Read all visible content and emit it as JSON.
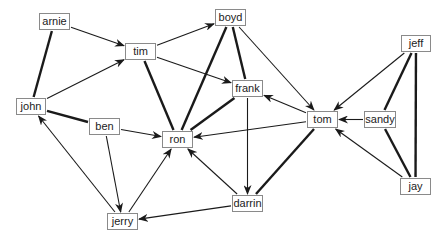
{
  "diagram": {
    "type": "directed-graph",
    "colors": {
      "line": "#1a1a1a",
      "node_border": "#8a8a8a",
      "text": "#222222",
      "background": "#ffffff"
    },
    "nodes": [
      {
        "id": "arnie",
        "label": "arnie",
        "x": 39,
        "y": 13,
        "w": 31
      },
      {
        "id": "tim",
        "label": "tim",
        "x": 125,
        "y": 43,
        "w": 31
      },
      {
        "id": "boyd",
        "label": "boyd",
        "x": 215,
        "y": 9,
        "w": 31
      },
      {
        "id": "frank",
        "label": "frank",
        "x": 232,
        "y": 80,
        "w": 31
      },
      {
        "id": "john",
        "label": "john",
        "x": 16,
        "y": 98,
        "w": 30
      },
      {
        "id": "ben",
        "label": "ben",
        "x": 89,
        "y": 118,
        "w": 31
      },
      {
        "id": "ron",
        "label": "ron",
        "x": 162,
        "y": 131,
        "w": 31
      },
      {
        "id": "tom",
        "label": "tom",
        "x": 307,
        "y": 111,
        "w": 31
      },
      {
        "id": "sandy",
        "label": "sandy",
        "x": 364,
        "y": 111,
        "w": 32
      },
      {
        "id": "jeff",
        "label": "jeff",
        "x": 401,
        "y": 35,
        "w": 30
      },
      {
        "id": "jay",
        "label": "jay",
        "x": 400,
        "y": 178,
        "w": 31
      },
      {
        "id": "darrin",
        "label": "darrin",
        "x": 232,
        "y": 195,
        "w": 31
      },
      {
        "id": "jerry",
        "label": "jerry",
        "x": 107,
        "y": 213,
        "w": 31
      }
    ],
    "edges": [
      {
        "from": "arnie",
        "to": "john",
        "style": "thick"
      },
      {
        "from": "arnie",
        "to": "tim",
        "style": "arrow"
      },
      {
        "from": "john",
        "to": "tim",
        "style": "arrow"
      },
      {
        "from": "john",
        "to": "ben",
        "style": "thick"
      },
      {
        "from": "tim",
        "to": "boyd",
        "style": "arrow"
      },
      {
        "from": "tim",
        "to": "frank",
        "style": "arrow"
      },
      {
        "from": "tim",
        "to": "ron",
        "style": "thick"
      },
      {
        "from": "boyd",
        "to": "ron",
        "style": "thick"
      },
      {
        "from": "boyd",
        "to": "frank",
        "style": "thick"
      },
      {
        "from": "boyd",
        "to": "tom",
        "style": "arrow"
      },
      {
        "from": "frank",
        "to": "ron",
        "style": "thick"
      },
      {
        "from": "frank",
        "to": "darrin",
        "style": "arrow"
      },
      {
        "from": "tom",
        "to": "frank",
        "style": "arrow"
      },
      {
        "from": "tom",
        "to": "ron",
        "style": "arrow"
      },
      {
        "from": "tom",
        "to": "darrin",
        "style": "thick"
      },
      {
        "from": "ben",
        "to": "ron",
        "style": "arrow"
      },
      {
        "from": "ben",
        "to": "jerry",
        "style": "arrow"
      },
      {
        "from": "jerry",
        "to": "john",
        "style": "arrow"
      },
      {
        "from": "jerry",
        "to": "ron",
        "style": "arrow"
      },
      {
        "from": "darrin",
        "to": "ron",
        "style": "arrow"
      },
      {
        "from": "darrin",
        "to": "jerry",
        "style": "arrow"
      },
      {
        "from": "jeff",
        "to": "tom",
        "style": "arrow"
      },
      {
        "from": "jeff",
        "to": "sandy",
        "style": "thick"
      },
      {
        "from": "jeff",
        "to": "jay",
        "style": "thick"
      },
      {
        "from": "sandy",
        "to": "tom",
        "style": "arrow"
      },
      {
        "from": "sandy",
        "to": "jay",
        "style": "thick"
      },
      {
        "from": "jay",
        "to": "tom",
        "style": "arrow"
      }
    ]
  }
}
